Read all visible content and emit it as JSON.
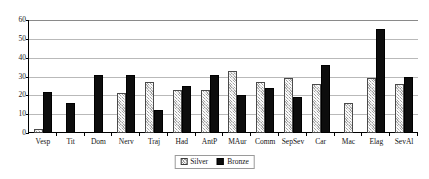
{
  "chart_data": {
    "type": "bar",
    "title": "",
    "xlabel": "",
    "ylabel": "",
    "ylim": [
      0,
      60
    ],
    "ytick_step": 10,
    "yticks": [
      0,
      10,
      20,
      30,
      40,
      50,
      60
    ],
    "grid": true,
    "legend_position": "bottom-center",
    "categories": [
      "Vesp",
      "Tit",
      "Dom",
      "Nerv",
      "Traj",
      "Had",
      "AntP",
      "MAur",
      "Comm",
      "SepSev",
      "Car",
      "Mac",
      "Elag",
      "SevAl"
    ],
    "series": [
      {
        "name": "Silver",
        "color": "#d4d4d4",
        "pattern": "hatched",
        "values": [
          2,
          0,
          0,
          21,
          27,
          23,
          23,
          33,
          27,
          29,
          26,
          16,
          29,
          26
        ]
      },
      {
        "name": "Bronze",
        "color": "#0d0d0d",
        "pattern": "solid",
        "values": [
          22,
          16,
          31,
          31,
          12,
          25,
          31,
          20,
          24,
          19,
          36,
          0,
          55,
          30
        ]
      }
    ]
  },
  "legend": {
    "items": [
      {
        "label": "Silver",
        "swatch": "silver-hatched-swatch"
      },
      {
        "label": "Bronze",
        "swatch": "bronze-solid-swatch"
      }
    ]
  }
}
